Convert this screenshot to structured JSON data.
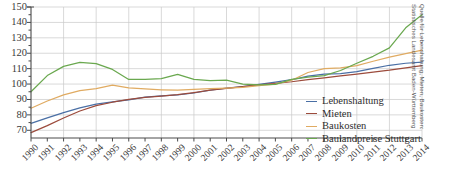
{
  "chart_data": {
    "type": "line",
    "title": "",
    "xlabel": "",
    "ylabel": "",
    "grid": true,
    "legend_position": "inside-right",
    "ylim": [
      65,
      150
    ],
    "yticks": [
      70,
      80,
      90,
      100,
      110,
      120,
      130,
      140,
      150
    ],
    "ytick_labels": [
      "70",
      "80",
      "90",
      "100",
      "110",
      "120",
      "130",
      "140",
      "150"
    ],
    "minor_ytick_step": 5,
    "x": [
      1990,
      1991,
      1992,
      1993,
      1994,
      1995,
      1996,
      1997,
      1998,
      1999,
      2000,
      2001,
      2002,
      2003,
      2004,
      2005,
      2006,
      2007,
      2008,
      2009,
      2010,
      2011,
      2012,
      2013,
      2014
    ],
    "xtick_labels": [
      "1990",
      "1991",
      "1992",
      "1993",
      "1994",
      "1995",
      "1996",
      "1997",
      "1998",
      "1999",
      "2000",
      "2001",
      "2002",
      "2003",
      "2004",
      "2005",
      "2006",
      "2007",
      "2008",
      "2009",
      "2010",
      "2011",
      "2012",
      "2013",
      "2014"
    ],
    "xgrid_years": [
      1990,
      1992,
      1994,
      1996,
      1998,
      2000,
      2002,
      2004,
      2006,
      2008,
      2010,
      2012,
      2014
    ],
    "series": [
      {
        "name": "Lebenshaltung",
        "color": "#4a6fa5",
        "values": [
          74.5,
          78.0,
          81.5,
          84.5,
          87.0,
          88.5,
          89.8,
          91.5,
          92.3,
          93.0,
          94.2,
          96.0,
          97.3,
          98.3,
          99.8,
          101.3,
          102.8,
          105.2,
          106.5,
          106.8,
          108.0,
          110.2,
          112.2,
          113.5,
          114.3
        ]
      },
      {
        "name": "Mieten",
        "color": "#9c4b3c",
        "values": [
          68.5,
          73.0,
          78.0,
          82.5,
          86.0,
          88.2,
          90.0,
          91.3,
          92.2,
          93.2,
          94.5,
          96.0,
          97.2,
          98.3,
          99.5,
          100.5,
          101.5,
          102.8,
          104.0,
          105.3,
          106.5,
          107.8,
          109.0,
          110.5,
          112.0
        ]
      },
      {
        "name": "Baukosten",
        "color": "#e0ab62",
        "values": [
          84.3,
          89.0,
          93.0,
          95.8,
          97.0,
          99.3,
          97.5,
          96.8,
          96.3,
          96.0,
          96.5,
          97.0,
          97.3,
          97.8,
          99.0,
          100.0,
          102.5,
          107.5,
          110.0,
          110.5,
          112.0,
          114.8,
          117.5,
          119.8,
          122.0
        ]
      },
      {
        "name": "Baulandpreise Stuttgart",
        "color": "#6aa84f",
        "values": [
          95.0,
          105.5,
          111.5,
          114.0,
          113.3,
          109.5,
          103.0,
          103.0,
          103.5,
          106.3,
          103.0,
          102.3,
          102.5,
          100.0,
          99.5,
          99.8,
          103.0,
          104.5,
          105.5,
          108.8,
          113.5,
          118.0,
          123.5,
          136.5,
          145.0
        ]
      }
    ]
  },
  "legend": {
    "items": [
      {
        "label": "Lebenshaltung",
        "color": "#4a6fa5"
      },
      {
        "label": "Mieten",
        "color": "#9c4b3c"
      },
      {
        "label": "Baukosten",
        "color": "#e0ab62"
      },
      {
        "label": "Baulandpreise Stuttgart",
        "color": "#6aa84f"
      }
    ]
  },
  "source_note": {
    "text": "Quelle für Lebenshaltung, Mieten, Baukosten:\nStatistisches Landesamt Baden-Württemberg"
  },
  "colors": {
    "grid": "#c9c9c9",
    "axis": "#4a4a4a",
    "plot_background": "#ffffff"
  }
}
